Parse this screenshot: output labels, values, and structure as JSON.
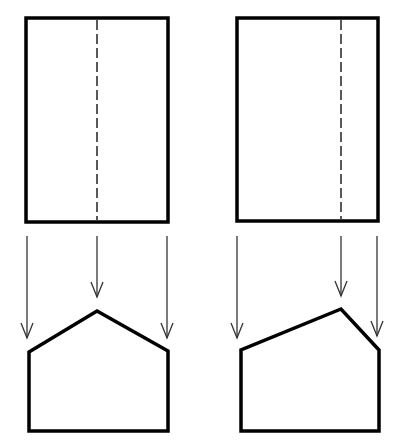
{
  "diagram": {
    "type": "orthographic-projection",
    "colors": {
      "background": "#ffffff",
      "outline": "#000000",
      "arrow": "#333333"
    },
    "views": [
      {
        "id": "left",
        "top_view": {
          "rect": {
            "x": 26,
            "y": 18,
            "w": 142,
            "h": 204
          },
          "hidden_edge_x": 97
        },
        "arrows": [
          {
            "x": 27,
            "y1": 236,
            "y2": 338
          },
          {
            "x": 97,
            "y1": 236,
            "y2": 297
          },
          {
            "x": 167,
            "y1": 236,
            "y2": 338
          }
        ],
        "front_view": {
          "points": [
            [
              29,
              431
            ],
            [
              29,
              352
            ],
            [
              97,
              311
            ],
            [
              168,
              351
            ],
            [
              168,
              431
            ]
          ]
        }
      },
      {
        "id": "right",
        "top_view": {
          "rect": {
            "x": 237,
            "y": 18,
            "w": 141,
            "h": 203
          },
          "hidden_edge_x": 341
        },
        "arrows": [
          {
            "x": 237,
            "y1": 236,
            "y2": 338
          },
          {
            "x": 341,
            "y1": 236,
            "y2": 296
          },
          {
            "x": 377,
            "y1": 236,
            "y2": 336
          }
        ],
        "front_view": {
          "points": [
            [
              241,
              431
            ],
            [
              241,
              350
            ],
            [
              341,
              309
            ],
            [
              379,
              350
            ],
            [
              379,
              431
            ]
          ]
        }
      }
    ]
  }
}
